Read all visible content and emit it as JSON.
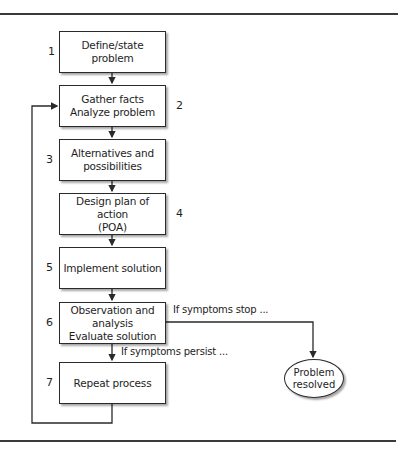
{
  "diagram": {
    "type": "flowchart",
    "steps": [
      {
        "number": "1",
        "lines": [
          "Define/state problem"
        ]
      },
      {
        "number": "2",
        "lines": [
          "Gather facts",
          "Analyze problem"
        ]
      },
      {
        "number": "3",
        "lines": [
          "Alternatives and",
          "possibilities"
        ]
      },
      {
        "number": "4",
        "lines": [
          "Design plan of action",
          "(POA)"
        ]
      },
      {
        "number": "5",
        "lines": [
          "Implement solution"
        ]
      },
      {
        "number": "6",
        "lines": [
          "Observation and",
          "analysis",
          "Evaluate solution"
        ]
      },
      {
        "number": "7",
        "lines": [
          "Repeat process"
        ]
      }
    ],
    "branches": {
      "stop_label": "If symptoms stop ...",
      "persist_label": "If symptoms persist ..."
    },
    "terminal": {
      "lines": [
        "Problem",
        "resolved"
      ]
    },
    "colors": {
      "line": "#2a2a2a",
      "background": "#ffffff"
    }
  }
}
